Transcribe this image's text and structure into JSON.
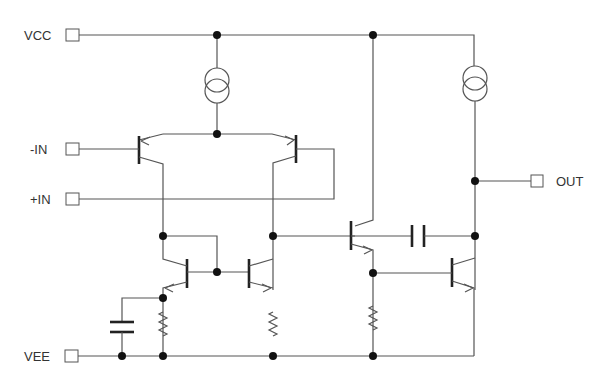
{
  "diagram": {
    "type": "circuit-schematic",
    "title": "",
    "pins": [
      {
        "id": "vcc",
        "label": "VCC"
      },
      {
        "id": "in_neg",
        "label": "-IN"
      },
      {
        "id": "in_pos",
        "label": "+IN"
      },
      {
        "id": "vee",
        "label": "VEE"
      },
      {
        "id": "out",
        "label": "OUT"
      }
    ],
    "components": [
      {
        "id": "I1",
        "kind": "current-source",
        "icon": "current-source-icon"
      },
      {
        "id": "I2",
        "kind": "current-source",
        "icon": "current-source-icon"
      },
      {
        "id": "Q1",
        "kind": "pnp-transistor",
        "role": "differential input (-IN)"
      },
      {
        "id": "Q2",
        "kind": "pnp-transistor",
        "role": "differential input (+IN)"
      },
      {
        "id": "Q3",
        "kind": "npn-transistor",
        "role": "current mirror"
      },
      {
        "id": "Q4",
        "kind": "npn-transistor",
        "role": "current mirror"
      },
      {
        "id": "Q5",
        "kind": "npn-transistor",
        "role": "gain stage"
      },
      {
        "id": "Q6",
        "kind": "npn-transistor",
        "role": "output stage"
      },
      {
        "id": "C1",
        "kind": "capacitor",
        "role": "compensation"
      },
      {
        "id": "C2",
        "kind": "capacitor",
        "role": "decoupling"
      },
      {
        "id": "R1",
        "kind": "resistor"
      },
      {
        "id": "R2",
        "kind": "resistor"
      },
      {
        "id": "R3",
        "kind": "resistor"
      }
    ],
    "colors": {
      "wire": "#555555",
      "junction": "#111111",
      "background": "#ffffff"
    }
  }
}
